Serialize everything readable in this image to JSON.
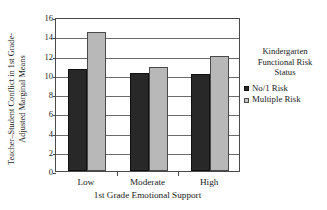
{
  "chart_data": {
    "type": "bar",
    "title": "",
    "xlabel": "1st Grade Emotional Support",
    "ylabel_lines": [
      "Teacher–Student Conflict in 1st Grade-",
      "Adjusted Marginal Means"
    ],
    "ylabel": "Teacher–Student Conflict in 1st Grade-Adjusted Marginal Means",
    "categories": [
      "Low",
      "Moderate",
      "High"
    ],
    "series": [
      {
        "name": "No/1 Risk",
        "values": [
          10.6,
          10.2,
          10.1
        ],
        "color": "#282828"
      },
      {
        "name": "Multiple Risk",
        "values": [
          14.4,
          10.8,
          12.0
        ],
        "color": "#b8b8b8"
      }
    ],
    "ylim": [
      0,
      16
    ],
    "ytick_values": [
      0,
      2,
      4,
      6,
      8,
      10,
      12,
      14,
      16
    ],
    "ytick_labels": [
      "0",
      "2",
      "4",
      "6",
      "8",
      "10",
      "12",
      "14",
      "16"
    ],
    "grid": true,
    "grid_axis": "y",
    "legend_position": "right",
    "legend": {
      "title_lines": [
        "Kindergarten",
        "Functional Risk",
        "Status"
      ],
      "title": "Kindergarten Functional Risk Status",
      "entries": [
        {
          "label": "No/1 Risk",
          "swatch": "dark-square-icon"
        },
        {
          "label": "Multiple Risk",
          "swatch": "light-square-icon"
        }
      ]
    }
  }
}
